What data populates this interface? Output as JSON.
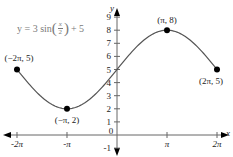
{
  "chart_data": {
    "type": "line",
    "title": "",
    "equation": {
      "prefix": "y = 3 sin",
      "frac_num": "x",
      "frac_den": "2",
      "suffix": "+ 5",
      "full": "y = 3 sin(x/2) + 5"
    },
    "xlabel": "x",
    "ylabel": "y",
    "xlim": [
      -6.2832,
      6.2832
    ],
    "ylim": [
      -1,
      9
    ],
    "x_ticks": [
      "-2π",
      "-π",
      "0",
      "π",
      "2π"
    ],
    "x_tick_values": [
      -6.2832,
      -3.1416,
      0,
      3.1416,
      6.2832
    ],
    "y_ticks": [
      "-1",
      "1",
      "2",
      "3",
      "4",
      "5",
      "6",
      "7",
      "8",
      "9"
    ],
    "y_tick_values": [
      -1,
      1,
      2,
      3,
      4,
      5,
      6,
      7,
      8,
      9
    ],
    "grid": false,
    "series": [
      {
        "name": "y = 3 sin(x/2) + 5",
        "function": "3*sin(x/2)+5",
        "domain": [
          -6.2832,
          6.2832
        ]
      }
    ],
    "points": [
      {
        "label": "(−2π, 5)",
        "x": -6.2832,
        "y": 5
      },
      {
        "label": "(−π, 2)",
        "x": -3.1416,
        "y": 2
      },
      {
        "label": "(π, 8)",
        "x": 3.1416,
        "y": 8
      },
      {
        "label": "(2π, 5)",
        "x": 6.2832,
        "y": 5
      }
    ]
  },
  "colors": {
    "curve": "#555555",
    "axis": "#666666",
    "point": "#000000",
    "text": "#222222",
    "equation": "#7a7a7a"
  }
}
